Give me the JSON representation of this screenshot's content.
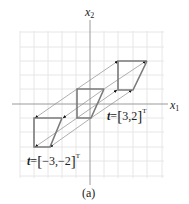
{
  "figure": {
    "caption": "(a)",
    "axes": {
      "x_label": "x",
      "x_sub": "1",
      "y_label": "x",
      "y_sub": "2"
    },
    "grid": {
      "x_range": [
        -5,
        5
      ],
      "y_range": [
        -5,
        5
      ],
      "step": 1
    },
    "shapes": {
      "original": {
        "points": [
          [
            -1,
            1
          ],
          [
            1,
            1
          ],
          [
            0,
            -1
          ],
          [
            -1,
            -1
          ]
        ],
        "description": "parallelogram-like shape at origin"
      },
      "translated_positive": {
        "translation": [
          3,
          2
        ],
        "points": [
          [
            2,
            3
          ],
          [
            4,
            3
          ],
          [
            3,
            1
          ],
          [
            2,
            1
          ]
        ]
      },
      "translated_negative": {
        "translation": [
          -3,
          -2
        ],
        "points": [
          [
            -4,
            -1
          ],
          [
            -2,
            -1
          ],
          [
            -3,
            -3
          ],
          [
            -4,
            -3
          ]
        ]
      }
    },
    "labels": {
      "t_positive": {
        "var": "t",
        "eq": "=",
        "open": "[",
        "value": "3,2",
        "close": "]",
        "sup": "T"
      },
      "t_negative": {
        "var": "t",
        "eq": "=",
        "open": "[",
        "value": "−3,−2",
        "close": "]",
        "sup": "T"
      }
    },
    "colors": {
      "grid": "#e6e6e6",
      "axis": "#9a9a9a",
      "shape": "#7a7a7a",
      "arrow": "#8c8c8c",
      "arrowhead": "#111111"
    }
  }
}
